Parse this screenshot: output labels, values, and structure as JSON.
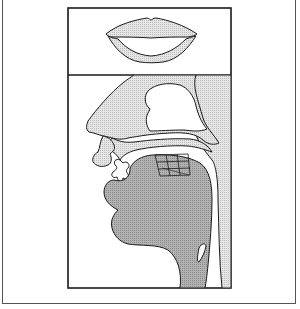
{
  "diagram": {
    "type": "articulatory-phonetics",
    "panels": [
      {
        "id": "lips-front-view",
        "description": "frontal view of lip shape"
      },
      {
        "id": "vocal-tract-sagittal",
        "description": "mid-sagittal section of vocal tract with tongue position grid"
      }
    ],
    "colors": {
      "outline": "#1a1a1a",
      "light_fill": "#d9d9d9",
      "dark_fill": "#a6a6a6",
      "background": "#ffffff",
      "frame": "#555555"
    },
    "tongue_grid": {
      "rows": 3,
      "cols": 3
    }
  }
}
